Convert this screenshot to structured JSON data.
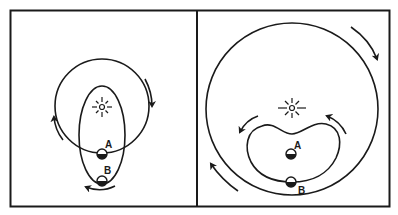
{
  "figure": {
    "panels": [
      {
        "id": "left",
        "description": "Small circular orbit intersecting an elongated elliptical orbit around a central star",
        "labels": {
          "a": "A",
          "b": "B"
        }
      },
      {
        "id": "right",
        "description": "Large circular orbit enclosing a kidney-shaped orbit around a central star",
        "labels": {
          "a": "A",
          "b": "B"
        }
      }
    ],
    "colors": {
      "line": "#1a1a1a",
      "background": "#ffffff"
    },
    "icons": {
      "star": "sun-icon",
      "body": "half-shaded-ball-icon",
      "arrow": "curved-arrow-icon"
    }
  }
}
